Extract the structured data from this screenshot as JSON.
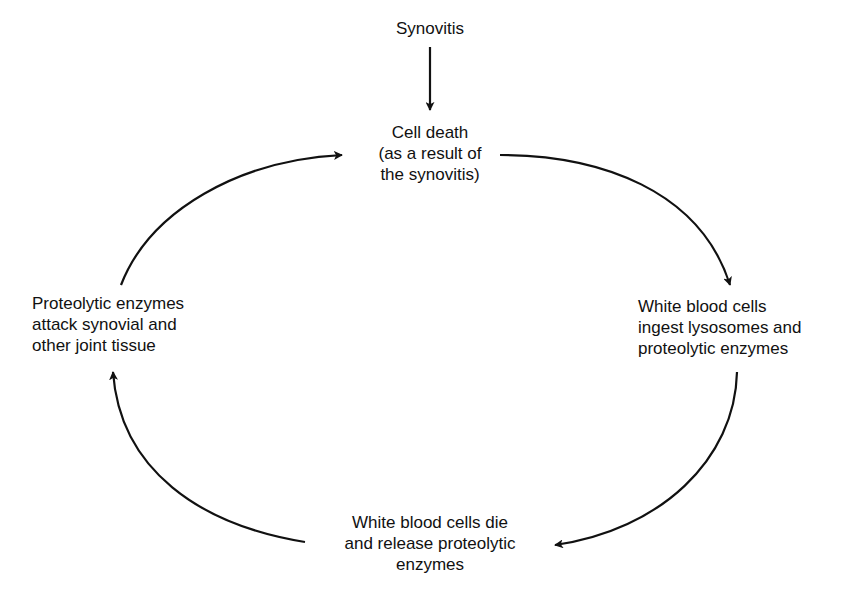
{
  "diagram": {
    "type": "cycle",
    "nodes": {
      "trigger": "Synovitis",
      "cell_death": "Cell death\n(as a result of\nthe synovitis)",
      "wbc_ingest": "White blood cells\ningest lysosomes and\nproteolytic enzymes",
      "wbc_die": "White blood cells die\nand release proteolytic\nenzymes",
      "enzymes_attack": "Proteolytic enzymes\nattack synovial and\nother joint tissue"
    },
    "edges": [
      {
        "from": "trigger",
        "to": "cell_death"
      },
      {
        "from": "cell_death",
        "to": "wbc_ingest"
      },
      {
        "from": "wbc_ingest",
        "to": "wbc_die"
      },
      {
        "from": "wbc_die",
        "to": "enzymes_attack"
      },
      {
        "from": "enzymes_attack",
        "to": "cell_death"
      }
    ],
    "colors": {
      "line": "#111111",
      "background": "#ffffff"
    }
  }
}
